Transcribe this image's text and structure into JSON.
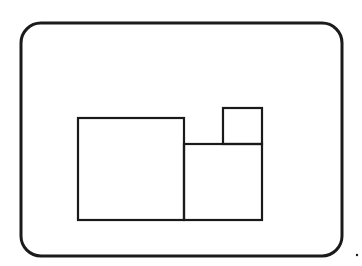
{
  "diagram": {
    "type": "line-drawing",
    "stroke_color": "#1a1a1a",
    "background_color": "#ffffff",
    "frame": {
      "x": 21,
      "y": 23,
      "width": 321,
      "height": 233,
      "corner_radius": 20,
      "stroke_width": 3
    },
    "shapes": [
      {
        "name": "large-rectangle",
        "x": 78,
        "y": 118,
        "width": 106,
        "height": 102
      },
      {
        "name": "medium-rectangle",
        "x": 184,
        "y": 144,
        "width": 78,
        "height": 76
      },
      {
        "name": "small-square",
        "x": 223,
        "y": 108,
        "width": 39,
        "height": 36
      }
    ],
    "marks": [
      {
        "name": "dot",
        "x": 357,
        "y": 255,
        "r": 1.2
      }
    ]
  }
}
